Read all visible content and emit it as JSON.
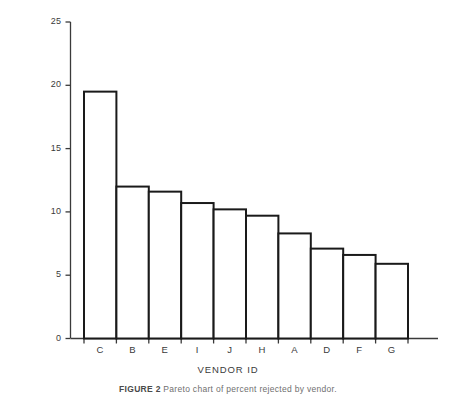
{
  "chart_data": {
    "type": "bar",
    "title": "",
    "xlabel": "VENDOR ID",
    "ylabel": "PERCENT REJECTED",
    "categories": [
      "C",
      "B",
      "E",
      "I",
      "J",
      "H",
      "A",
      "D",
      "F",
      "G"
    ],
    "values": [
      19.5,
      12.0,
      11.6,
      10.7,
      10.2,
      9.7,
      8.3,
      7.1,
      6.6,
      5.9
    ],
    "ylim": [
      0,
      25
    ],
    "yticks": [
      0,
      5,
      10,
      15,
      20,
      25
    ],
    "ytick_labels": [
      "0",
      "5",
      "10",
      "15",
      "20",
      "25"
    ],
    "grid": false,
    "legend": "none",
    "bar_style": {
      "fill": "#ffffff",
      "stroke": "#1a1a1a",
      "stroke_width": 2
    },
    "axis_color": "#3a3a3a"
  },
  "figure": {
    "caption_label": "FIGURE 2",
    "caption_text": "Pareto chart of percent rejected by vendor."
  }
}
